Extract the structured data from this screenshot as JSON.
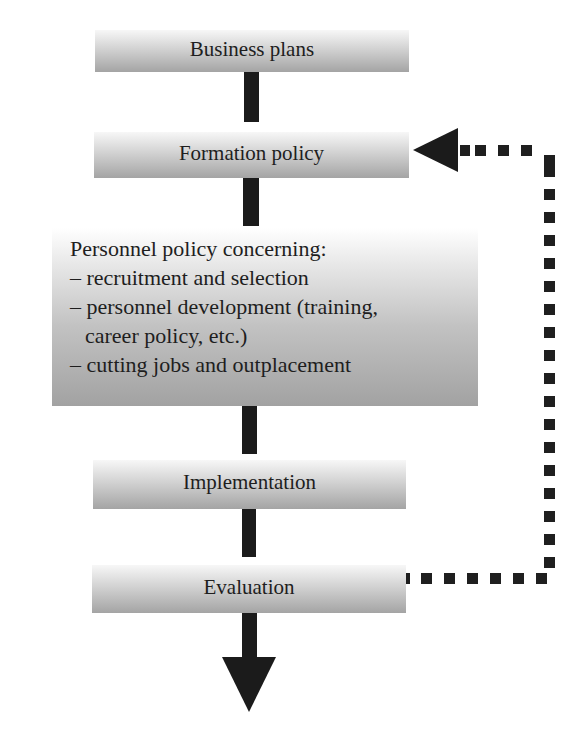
{
  "diagram": {
    "type": "flowchart",
    "nodes": [
      {
        "id": "business-plans",
        "label": "Business plans"
      },
      {
        "id": "formation-policy",
        "label": "Formation policy"
      },
      {
        "id": "personnel-policy",
        "lines": [
          "Personnel policy concerning:",
          "– recruitment and selection",
          "– personnel development (training,",
          "career policy, etc.)",
          "– cutting jobs and outplacement"
        ]
      },
      {
        "id": "implementation",
        "label": "Implementation"
      },
      {
        "id": "evaluation",
        "label": "Evaluation"
      }
    ],
    "edges": [
      {
        "from": "business-plans",
        "to": "formation-policy",
        "style": "solid"
      },
      {
        "from": "formation-policy",
        "to": "personnel-policy",
        "style": "solid"
      },
      {
        "from": "personnel-policy",
        "to": "implementation",
        "style": "solid"
      },
      {
        "from": "implementation",
        "to": "evaluation",
        "style": "solid"
      },
      {
        "from": "evaluation",
        "to": "output",
        "style": "solid-arrow"
      },
      {
        "from": "evaluation",
        "to": "formation-policy",
        "style": "dotted-feedback-arrow"
      }
    ]
  },
  "colors": {
    "connector": "#1b1b1b",
    "box_top": "#f7f7f7",
    "box_bottom": "#a4a4a4",
    "text": "#1e1e1e"
  }
}
